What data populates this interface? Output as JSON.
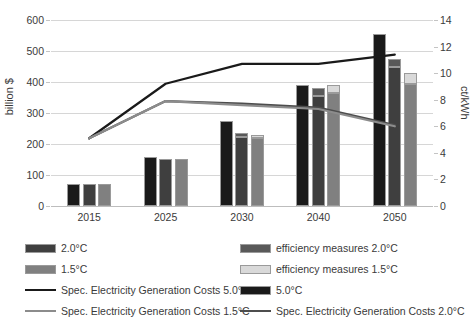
{
  "chart_data": {
    "type": "bar",
    "title": "",
    "subtitle": "",
    "xlabel": "",
    "ylabel": "billion $",
    "ylabel_secondary": "ct/kWh",
    "categories": [
      "2015",
      "2025",
      "2030",
      "2040",
      "2050"
    ],
    "ylim": [
      0,
      600
    ],
    "yticks": [
      0,
      100,
      200,
      300,
      400,
      500,
      600
    ],
    "ylim_secondary": [
      0,
      14
    ],
    "yticks_secondary": [
      0,
      2,
      4,
      6,
      8,
      10,
      12,
      14
    ],
    "grid": true,
    "legend_position": "bottom",
    "bar_series": [
      {
        "name": "5.0°C",
        "color": "#1a1a1a",
        "values": [
          72,
          158,
          275,
          390,
          555
        ]
      },
      {
        "name": "2.0°C",
        "color": "#3f3f3f",
        "values": [
          72,
          153,
          222,
          355,
          450
        ]
      },
      {
        "name": "efficiency measures 2.0°C",
        "color": "#595959",
        "stacked_on": "2.0°C",
        "values": [
          0,
          0,
          12,
          25,
          25
        ]
      },
      {
        "name": "1.5°C",
        "color": "#808080",
        "values": [
          72,
          152,
          218,
          365,
          395
        ]
      },
      {
        "name": "efficiency measures 1.5°C",
        "color": "#d9d9d9",
        "stacked_on": "1.5°C",
        "values": [
          0,
          0,
          12,
          25,
          35
        ]
      }
    ],
    "line_series": [
      {
        "name": "Spec. Electricity Generation Costs 5.0°C",
        "color": "#1a1a1a",
        "axis": "secondary",
        "values": [
          5.1,
          9.2,
          10.7,
          10.7,
          11.4
        ]
      },
      {
        "name": "Spec. Electricity Generation Costs 2.0°C",
        "color": "#4d4d4d",
        "axis": "secondary",
        "values": [
          5.1,
          7.9,
          7.7,
          7.4,
          6.1
        ]
      },
      {
        "name": "Spec. Electricity Generation Costs 1.5°C",
        "color": "#8c8c8c",
        "axis": "secondary",
        "values": [
          5.1,
          7.9,
          7.6,
          7.3,
          6.0
        ]
      }
    ]
  },
  "axis": {
    "left_ticks": [
      "600",
      "500",
      "400",
      "300",
      "200",
      "100",
      "0"
    ],
    "right_ticks": [
      "14",
      "12",
      "10",
      "8",
      "6",
      "4",
      "2",
      "0"
    ],
    "left_title": "billion $",
    "right_title": "ct/kWh",
    "categories": [
      "2015",
      "2025",
      "2030",
      "2040",
      "2050"
    ]
  },
  "legend": {
    "left_column": [
      {
        "type": "swatch",
        "label": "2.0°C",
        "color": "#3f3f3f"
      },
      {
        "type": "swatch",
        "label": "1.5°C",
        "color": "#808080"
      },
      {
        "type": "line",
        "label": "Spec. Electricity Generation Costs 5.0°C",
        "color": "#1a1a1a"
      },
      {
        "type": "line",
        "label": "Spec. Electricity Generation Costs 1.5°C",
        "color": "#8c8c8c"
      }
    ],
    "right_column": [
      {
        "type": "swatch",
        "label": "efficiency measures 2.0°C",
        "color": "#595959"
      },
      {
        "type": "swatch",
        "label": "efficiency measures 1.5°C",
        "color": "#d9d9d9"
      },
      {
        "type": "swatch",
        "label": "5.0°C",
        "color": "#1a1a1a"
      },
      {
        "type": "line",
        "label": "Spec. Electricity Generation Costs 2.0°C",
        "color": "#4d4d4d"
      }
    ]
  }
}
